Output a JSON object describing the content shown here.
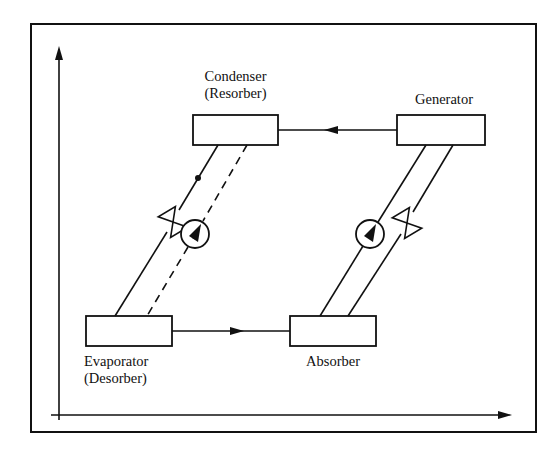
{
  "diagram": {
    "title": "",
    "colors": {
      "stroke": "#111111",
      "background": "#ffffff"
    },
    "components": {
      "condenser": {
        "label": "Condenser",
        "sublabel": "(Resorber)"
      },
      "generator": {
        "label": "Generator"
      },
      "evaporator": {
        "label": "Evaporator",
        "sublabel": "(Desorber)"
      },
      "absorber": {
        "label": "Absorber"
      }
    },
    "axes": {
      "x_label": "",
      "y_label": ""
    },
    "connections": [
      {
        "from": "Generator",
        "to": "Condenser",
        "style": "solid",
        "arrow": "left"
      },
      {
        "from": "Evaporator",
        "to": "Absorber",
        "style": "solid",
        "arrow": "right"
      },
      {
        "from": "Condenser",
        "to": "Evaporator",
        "style": "solid",
        "devices": [
          "flow-dot",
          "expansion-valve"
        ]
      },
      {
        "from": "Evaporator",
        "to": "Condenser",
        "style": "dashed",
        "devices": [
          "pump"
        ]
      },
      {
        "from": "Absorber",
        "to": "Generator",
        "style": "solid",
        "devices": [
          "pump"
        ]
      },
      {
        "from": "Generator",
        "to": "Absorber",
        "style": "solid",
        "devices": [
          "expansion-valve"
        ]
      }
    ]
  }
}
